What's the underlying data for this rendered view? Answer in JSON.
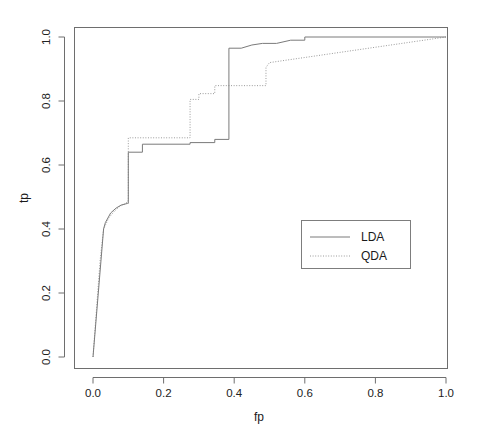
{
  "chart_data": {
    "type": "line",
    "title": "",
    "xlabel": "fp",
    "ylabel": "tp",
    "xlim": [
      0.0,
      1.0
    ],
    "ylim": [
      0.0,
      1.0
    ],
    "grid": false,
    "frame": "box",
    "legend_position": "center-right",
    "xticks": [
      "0.0",
      "0.2",
      "0.4",
      "0.6",
      "0.8",
      "1.0"
    ],
    "xtick_values": [
      0.0,
      0.2,
      0.4,
      0.6,
      0.8,
      1.0
    ],
    "yticks": [
      "0.0",
      "0.2",
      "0.4",
      "0.6",
      "0.8",
      "1.0"
    ],
    "ytick_values": [
      0.0,
      0.2,
      0.4,
      0.6,
      0.8,
      1.0
    ],
    "series": [
      {
        "name": "LDA",
        "style": "solid",
        "color": "#7a7a7a",
        "x": [
          0.0,
          0.03,
          0.035,
          0.05,
          0.065,
          0.08,
          0.098,
          0.098,
          0.1,
          0.1,
          0.14,
          0.14,
          0.275,
          0.275,
          0.345,
          0.345,
          0.385,
          0.385,
          0.42,
          0.45,
          0.48,
          0.52,
          0.56,
          0.6,
          0.6,
          1.0
        ],
        "y": [
          0.0,
          0.4,
          0.42,
          0.45,
          0.465,
          0.475,
          0.48,
          0.48,
          0.48,
          0.64,
          0.64,
          0.665,
          0.665,
          0.67,
          0.67,
          0.68,
          0.68,
          0.965,
          0.965,
          0.975,
          0.98,
          0.98,
          0.99,
          0.99,
          1.0,
          1.0
        ]
      },
      {
        "name": "QDA",
        "style": "dotted",
        "color": "#9a9a9a",
        "x": [
          0.0,
          0.02,
          0.03,
          0.045,
          0.06,
          0.075,
          0.09,
          0.098,
          0.098,
          0.1,
          0.1,
          0.275,
          0.275,
          0.3,
          0.3,
          0.345,
          0.345,
          0.49,
          0.49,
          0.5,
          1.0
        ],
        "y": [
          0.0,
          0.3,
          0.4,
          0.435,
          0.455,
          0.47,
          0.478,
          0.485,
          0.485,
          0.49,
          0.685,
          0.685,
          0.805,
          0.805,
          0.823,
          0.823,
          0.848,
          0.848,
          0.905,
          0.92,
          1.0
        ]
      }
    ],
    "notes": {
      "lda_description": "Solid grey ROC curve, rises steeply to tp~0.48 at fp~0.10, steps to 0.64, plateau ~0.67 until fp~0.385, jumps to ~0.965, reaches 1.0 at fp~0.60.",
      "qda_description": "Dotted grey ROC curve, rises to tp~0.49 at fp~0.10, steps to 0.685, then 0.805 at fp~0.275, 0.848 at fp~0.345, 0.92 at fp~0.50, linearly to 1.0 at fp=1.0."
    }
  },
  "legend": {
    "entries": [
      {
        "label": "LDA",
        "style": "solid"
      },
      {
        "label": "QDA",
        "style": "dotted"
      }
    ]
  },
  "axes": {
    "x_title": "fp",
    "y_title": "tp"
  }
}
